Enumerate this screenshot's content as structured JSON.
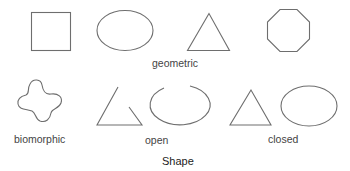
{
  "diagram": {
    "title": "Shape",
    "groups": [
      {
        "label": "geometric",
        "shapes": [
          "square",
          "ellipse",
          "triangle",
          "octagon"
        ]
      },
      {
        "label": "biomorphic",
        "shapes": [
          "blob"
        ]
      },
      {
        "label": "open",
        "shapes": [
          "open-triangle",
          "open-ellipse"
        ]
      },
      {
        "label": "closed",
        "shapes": [
          "triangle",
          "ellipse"
        ]
      }
    ],
    "colors": {
      "stroke": "#6e6e6e",
      "label": "#444444",
      "title": "#222222",
      "background": "#ffffff"
    }
  }
}
